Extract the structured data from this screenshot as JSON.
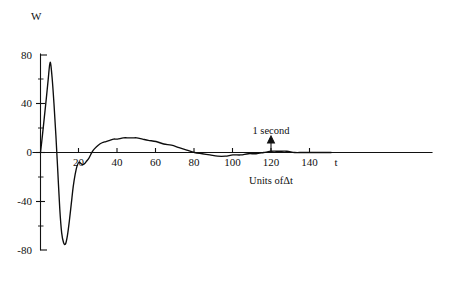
{
  "chart_data": {
    "type": "line",
    "title": "",
    "subtitle": "",
    "xlabel": "t",
    "ylabel": "W",
    "xaxis_caption": "Units ofΔt",
    "xlim": [
      -4,
      152
    ],
    "ylim": [
      -88,
      88
    ],
    "grid": false,
    "legend": false,
    "legend_position": "none",
    "x_ticks": [
      20,
      40,
      60,
      80,
      100,
      120,
      140
    ],
    "x_tick_labels": [
      "20",
      "40",
      "60",
      "80",
      "100",
      "120",
      "140"
    ],
    "y_ticks": [
      -80,
      -40,
      0,
      40,
      80
    ],
    "y_tick_labels": [
      "-80",
      "-40",
      "0",
      "40",
      "80"
    ],
    "y_minor_ticks": [
      -60,
      -20,
      20,
      60
    ],
    "annotations": [
      {
        "text": "1 second",
        "x": 120,
        "y": 0,
        "marker": "up-arrow"
      }
    ],
    "series": [
      {
        "name": "W",
        "x": [
          0,
          1,
          2,
          3,
          4,
          5,
          6,
          7,
          8,
          9,
          10,
          11,
          12,
          13,
          14,
          15,
          16,
          17,
          18,
          19,
          20,
          21,
          22,
          23,
          24,
          25,
          26,
          27,
          28,
          30,
          32,
          34,
          36,
          38,
          40,
          43,
          46,
          48,
          50,
          53,
          56,
          60,
          64,
          68,
          72,
          76,
          80,
          84,
          88,
          92,
          96,
          100,
          104,
          108,
          112,
          116,
          120,
          124,
          128,
          132,
          136,
          140,
          144,
          148,
          151
        ],
        "values": [
          0,
          14,
          29,
          44,
          60,
          74,
          62,
          40,
          14,
          -16,
          -46,
          -66,
          -74,
          -75,
          -68,
          -56,
          -42,
          -28,
          -18,
          -11,
          -8,
          -9,
          -10,
          -9,
          -7,
          -5,
          -2,
          1,
          3,
          6,
          8,
          9,
          10,
          11,
          11,
          12,
          12,
          12,
          12,
          11,
          10,
          9,
          7,
          6,
          4,
          2,
          0,
          -1,
          -2,
          -3,
          -3,
          -2,
          -2,
          -1,
          -1,
          0,
          1,
          1,
          1,
          0,
          0,
          0,
          0,
          0,
          0
        ]
      }
    ],
    "peaks": {
      "first_max": {
        "x": 5,
        "y": 74
      },
      "first_min": {
        "x": 13,
        "y": -75
      },
      "secondary_ripple_min": {
        "x": 22,
        "y": -10
      },
      "broad_max": {
        "x": 47,
        "y": 12
      },
      "zero_crossing": {
        "x": 80,
        "y": 0
      },
      "shallow_min": {
        "x": 93,
        "y": -3
      }
    }
  }
}
